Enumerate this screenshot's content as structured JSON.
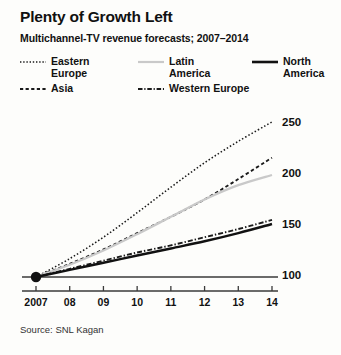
{
  "title": "Plenty of Growth Left",
  "subtitle": "Multichannel-TV revenue forecasts; 2007–2014",
  "source": "Source: SNL Kagan",
  "legend": {
    "items": [
      {
        "label": "Eastern\nEurope",
        "style": "dotted",
        "color": "#1a1a1a",
        "icon": "dotted-line-swatch"
      },
      {
        "label": "Latin\nAmerica",
        "style": "solid",
        "color": "#c9c9c9",
        "icon": "solid-line-swatch"
      },
      {
        "label": "North\nAmerica",
        "style": "solid",
        "color": "#111111",
        "icon": "solid-line-swatch"
      },
      {
        "label": "Asia",
        "style": "dashed",
        "color": "#1a1a1a",
        "icon": "dashed-line-swatch"
      },
      {
        "label": "Western Europe",
        "style": "dashdot",
        "color": "#1a1a1a",
        "icon": "dash-dot-line-swatch"
      }
    ]
  },
  "chart_data": {
    "type": "line",
    "title": "Plenty of Growth Left",
    "subtitle": "Multichannel-TV revenue forecasts; 2007–2014",
    "xlabel": "",
    "ylabel": "",
    "x": [
      2007,
      2008,
      2009,
      2010,
      2011,
      2012,
      2013,
      2014
    ],
    "categories": [
      "2007",
      "08",
      "09",
      "10",
      "11",
      "12",
      "13",
      "14"
    ],
    "ytick_labels": [
      "100",
      "150",
      "200",
      "250"
    ],
    "ytick_values": [
      100,
      150,
      200,
      250
    ],
    "ylim": [
      95,
      258
    ],
    "xlim": [
      2007,
      2014
    ],
    "grid": false,
    "legend_position": "top",
    "index_base": 100,
    "origin_marker": true,
    "series": [
      {
        "name": "Eastern Europe",
        "style": "dotted",
        "color": "#1a1a1a",
        "values": [
          100,
          118,
          139,
          163,
          188,
          212,
          233,
          252
        ]
      },
      {
        "name": "Asia",
        "style": "dashed",
        "color": "#1a1a1a",
        "values": [
          100,
          113,
          127,
          143,
          159,
          176,
          196,
          217
        ]
      },
      {
        "name": "Latin America",
        "style": "solid",
        "color": "#c9c9c9",
        "values": [
          100,
          112,
          126,
          142,
          159,
          176,
          190,
          200
        ]
      },
      {
        "name": "Western Europe",
        "style": "dashdot",
        "color": "#1a1a1a",
        "values": [
          100,
          108,
          116,
          124,
          131,
          139,
          147,
          156
        ]
      },
      {
        "name": "North America",
        "style": "solid",
        "color": "#111111",
        "values": [
          100,
          107,
          114,
          121,
          128,
          135,
          143,
          152
        ]
      }
    ]
  }
}
